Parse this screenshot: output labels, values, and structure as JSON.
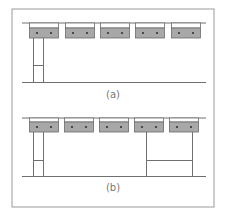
{
  "figure": {
    "colors": {
      "frame": "#9a9a9a",
      "line": "#6f6f6f",
      "box_fill": "#a8a8a8",
      "box_stroke": "#6a6a6a",
      "dot": "#333333"
    },
    "panels": [
      {
        "label": "(a)",
        "ceiling_y": 23,
        "floor_y": 82,
        "label_y": 98,
        "boxes_x": [
          29,
          65,
          100,
          135,
          171
        ],
        "box_top": 28,
        "box_bottom": 38,
        "supports": [
          {
            "x1": 33,
            "x2": 43,
            "crossbar_y": 65
          }
        ]
      },
      {
        "label": "(b)",
        "ceiling_y": 118,
        "floor_y": 176,
        "label_y": 191,
        "boxes_x": [
          29,
          64,
          99,
          134,
          169
        ],
        "box_top": 122,
        "box_bottom": 132,
        "supports": [
          {
            "x1": 33,
            "x2": 43,
            "crossbar_y": 160
          },
          {
            "x1": 146,
            "x2": 192,
            "crossbar_y": 160
          }
        ]
      }
    ]
  }
}
